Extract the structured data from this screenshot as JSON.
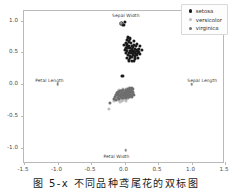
{
  "caption": "图 5-x  不同品种鸢尾花的双标图",
  "legend": {
    "position": "upper right",
    "items": [
      {
        "label": "setosa",
        "color": "#1a1a1a"
      },
      {
        "label": "versicolor",
        "color": "#bdbdbd"
      },
      {
        "label": "virginica",
        "color": "#6e6e6e"
      }
    ]
  },
  "chart_data": {
    "type": "scatter",
    "title": "",
    "xlabel": "",
    "ylabel": "",
    "xlim": [
      -1.5,
      1.5
    ],
    "ylim": [
      -1.25,
      1.15
    ],
    "grid": false,
    "xticks": [
      "-1.5",
      "-1.0",
      "-0.5",
      "0.0",
      "0.5",
      "1.0",
      "1.5"
    ],
    "xtick_values": [
      -1.5,
      -1.0,
      -0.5,
      0.0,
      0.5,
      1.0,
      1.5
    ],
    "yticks": [
      "1.0",
      "0.5",
      "0.0",
      "-0.5",
      "-1.0"
    ],
    "ytick_values": [
      1.0,
      0.5,
      0.0,
      -0.5,
      -1.0
    ],
    "annotations": [
      {
        "text": "Sepal Width",
        "x": 0.02,
        "y": 1.08,
        "point_x": -0.045,
        "point_y": 0.955
      },
      {
        "text": "Petal Length",
        "x": -1.12,
        "y": 0.075,
        "point_x": -1.0,
        "point_y": 0.0
      },
      {
        "text": "Sepal Length",
        "x": 1.16,
        "y": 0.075,
        "point_x": 1.0,
        "point_y": 0.0
      },
      {
        "text": "Petal Width",
        "x": -0.12,
        "y": -1.12,
        "point_x": 0.02,
        "point_y": -1.03
      }
    ],
    "series": [
      {
        "name": "setosa",
        "color": "#1a1a1a",
        "points": [
          [
            -0.045,
            0.955
          ],
          [
            -0.015,
            0.93
          ],
          [
            0.005,
            0.975
          ],
          [
            0.04,
            0.7
          ],
          [
            0.055,
            0.735
          ],
          [
            0.085,
            0.72
          ],
          [
            0.02,
            0.655
          ],
          [
            0.065,
            0.66
          ],
          [
            0.1,
            0.645
          ],
          [
            0.135,
            0.675
          ],
          [
            -0.005,
            0.615
          ],
          [
            0.03,
            0.625
          ],
          [
            0.07,
            0.605
          ],
          [
            0.105,
            0.6
          ],
          [
            0.145,
            0.62
          ],
          [
            0.175,
            0.595
          ],
          [
            0.015,
            0.575
          ],
          [
            0.05,
            0.565
          ],
          [
            0.085,
            0.57
          ],
          [
            0.115,
            0.555
          ],
          [
            0.15,
            0.56
          ],
          [
            0.185,
            0.545
          ],
          [
            0.215,
            0.555
          ],
          [
            0.005,
            0.535
          ],
          [
            0.04,
            0.525
          ],
          [
            0.075,
            0.53
          ],
          [
            0.11,
            0.52
          ],
          [
            0.145,
            0.515
          ],
          [
            0.18,
            0.525
          ],
          [
            0.22,
            0.51
          ],
          [
            0.255,
            0.545
          ],
          [
            0.025,
            0.495
          ],
          [
            0.06,
            0.49
          ],
          [
            0.095,
            0.485
          ],
          [
            0.13,
            0.495
          ],
          [
            0.165,
            0.48
          ],
          [
            0.2,
            0.49
          ],
          [
            0.235,
            0.475
          ],
          [
            0.05,
            0.455
          ],
          [
            0.085,
            0.45
          ],
          [
            0.12,
            0.46
          ],
          [
            0.155,
            0.445
          ],
          [
            0.19,
            0.455
          ],
          [
            0.03,
            0.42
          ],
          [
            0.075,
            0.41
          ],
          [
            0.115,
            0.425
          ],
          [
            0.155,
            0.405
          ],
          [
            0.2,
            0.415
          ],
          [
            0.06,
            0.375
          ],
          [
            0.105,
            0.365
          ],
          [
            0.02,
            0.56
          ],
          [
            0.125,
            0.585
          ],
          [
            0.19,
            0.63
          ],
          [
            0.225,
            0.6
          ],
          [
            0.07,
            0.685
          ],
          [
            0.11,
            0.555
          ],
          [
            0.035,
            0.595
          ],
          [
            0.16,
            0.5
          ],
          [
            0.205,
            0.535
          ],
          [
            0.145,
            0.365
          ],
          [
            -0.03,
            0.125
          ]
        ]
      },
      {
        "name": "versicolor",
        "color": "#bdbdbd",
        "points": [
          [
            -0.235,
            -0.385
          ],
          [
            -0.16,
            -0.255
          ],
          [
            -0.13,
            -0.22
          ],
          [
            -0.115,
            -0.195
          ],
          [
            -0.1,
            -0.175
          ],
          [
            -0.085,
            -0.205
          ],
          [
            -0.075,
            -0.16
          ],
          [
            -0.065,
            -0.23
          ],
          [
            -0.055,
            -0.145
          ],
          [
            -0.05,
            -0.19
          ],
          [
            -0.04,
            -0.165
          ],
          [
            -0.035,
            -0.215
          ],
          [
            -0.03,
            -0.135
          ],
          [
            -0.02,
            -0.18
          ],
          [
            -0.015,
            -0.155
          ],
          [
            -0.01,
            -0.2
          ],
          [
            0.0,
            -0.17
          ],
          [
            0.005,
            -0.125
          ],
          [
            0.01,
            -0.195
          ],
          [
            0.02,
            -0.15
          ],
          [
            0.025,
            -0.185
          ],
          [
            0.03,
            -0.115
          ],
          [
            0.04,
            -0.16
          ],
          [
            0.045,
            -0.21
          ],
          [
            0.05,
            -0.14
          ],
          [
            0.055,
            -0.175
          ],
          [
            0.065,
            -0.105
          ],
          [
            0.07,
            -0.155
          ],
          [
            0.075,
            -0.19
          ],
          [
            0.085,
            -0.13
          ],
          [
            -0.09,
            -0.25
          ],
          [
            -0.07,
            -0.275
          ],
          [
            -0.045,
            -0.255
          ],
          [
            -0.02,
            -0.245
          ],
          [
            0.0,
            -0.225
          ],
          [
            0.015,
            -0.26
          ],
          [
            0.035,
            -0.235
          ],
          [
            0.055,
            -0.22
          ],
          [
            -0.125,
            -0.165
          ],
          [
            -0.11,
            -0.135
          ],
          [
            -0.095,
            -0.115
          ],
          [
            -0.08,
            -0.095
          ],
          [
            -0.06,
            -0.1
          ],
          [
            -0.04,
            -0.085
          ],
          [
            -0.02,
            -0.075
          ],
          [
            0.0,
            -0.09
          ],
          [
            0.02,
            -0.07
          ],
          [
            0.04,
            -0.08
          ],
          [
            0.06,
            -0.06
          ],
          [
            0.08,
            -0.075
          ]
        ]
      },
      {
        "name": "virginica",
        "color": "#6e6e6e",
        "points": [
          [
            -0.215,
            -0.295
          ],
          [
            -0.14,
            -0.195
          ],
          [
            -0.12,
            -0.165
          ],
          [
            -0.105,
            -0.14
          ],
          [
            -0.09,
            -0.12
          ],
          [
            -0.075,
            -0.175
          ],
          [
            -0.06,
            -0.105
          ],
          [
            -0.05,
            -0.15
          ],
          [
            -0.04,
            -0.125
          ],
          [
            -0.03,
            -0.165
          ],
          [
            -0.02,
            -0.095
          ],
          [
            -0.01,
            -0.14
          ],
          [
            0.0,
            -0.115
          ],
          [
            0.005,
            -0.16
          ],
          [
            0.015,
            -0.085
          ],
          [
            0.02,
            -0.13
          ],
          [
            0.03,
            -0.105
          ],
          [
            0.035,
            -0.145
          ],
          [
            0.045,
            -0.075
          ],
          [
            0.05,
            -0.12
          ],
          [
            0.06,
            -0.095
          ],
          [
            0.065,
            -0.135
          ],
          [
            0.075,
            -0.065
          ],
          [
            0.08,
            -0.11
          ],
          [
            0.09,
            -0.085
          ],
          [
            0.095,
            -0.125
          ],
          [
            0.105,
            -0.055
          ],
          [
            0.11,
            -0.1
          ],
          [
            0.12,
            -0.075
          ],
          [
            0.13,
            -0.115
          ],
          [
            -0.155,
            -0.225
          ],
          [
            -0.13,
            -0.24
          ],
          [
            -0.1,
            -0.215
          ],
          [
            -0.08,
            -0.23
          ],
          [
            -0.055,
            -0.205
          ],
          [
            -0.03,
            -0.22
          ],
          [
            -0.005,
            -0.2
          ],
          [
            0.02,
            -0.215
          ],
          [
            0.045,
            -0.19
          ],
          [
            0.07,
            -0.205
          ],
          [
            0.095,
            -0.18
          ],
          [
            0.115,
            -0.195
          ],
          [
            0.14,
            -0.17
          ],
          [
            0.125,
            -0.14
          ],
          [
            0.105,
            -0.165
          ],
          [
            0.085,
            -0.145
          ],
          [
            0.065,
            -0.17
          ],
          [
            0.04,
            -0.155
          ],
          [
            0.015,
            -0.175
          ],
          [
            -0.01,
            -0.185
          ]
        ]
      }
    ]
  }
}
